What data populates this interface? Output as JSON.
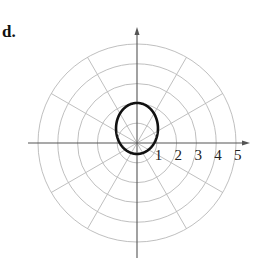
{
  "panel": {
    "label": "d."
  },
  "colors": {
    "grid": "#b8b8b8",
    "axis": "#555555",
    "curve": "#111111",
    "text": "#222222"
  },
  "chart_data": {
    "type": "line",
    "subtype": "polar",
    "title": "",
    "panel_label": "d.",
    "xlabel": "",
    "ylabel": "",
    "polar_grid": {
      "rings": [
        1,
        2,
        3,
        4,
        5
      ],
      "spoke_step_degrees": 30,
      "r_max": 5
    },
    "tick_labels": [
      "1",
      "2",
      "3",
      "4",
      "5"
    ],
    "curve": {
      "shape": "ellipse (conic, vertical major axis, focus at pole)",
      "equation_form": "r = ep / (1 - e·sinθ)",
      "eccentricity": 0.57,
      "ep": 0.87,
      "r_at_90deg": 2.0,
      "r_at_270deg": 0.55,
      "x_extent": [
        -0.9,
        0.9
      ],
      "y_extent": [
        -0.55,
        2.0
      ]
    },
    "grid": true,
    "legend": null
  },
  "layout": {
    "center_x": 137,
    "center_y": 143,
    "px_per_unit": 19.8,
    "axis_left": 28,
    "axis_right": 250,
    "axis_top": 27,
    "axis_bottom": 258
  }
}
